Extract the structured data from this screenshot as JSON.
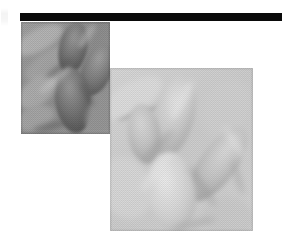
{
  "figure": {
    "background_color": "#ffffff",
    "width": 282,
    "height": 251,
    "caption_text": "",
    "header_rule": {
      "name": "black-header-rule",
      "color": "#0a0a0a",
      "x": 20,
      "y": 13,
      "width": 262,
      "height": 8
    },
    "edge_artifact": {
      "name": "scan-edge-artifact",
      "color": "#e8e8e8",
      "x": 1,
      "y": 8,
      "width": 7,
      "height": 18
    },
    "panels": [
      {
        "id": "panel-a",
        "label": "",
        "description": "darker grayscale micrograph of overlapping elongated rounded cell structures",
        "x": 21,
        "y": 22,
        "width": 89,
        "height": 112,
        "base_color": "#8e8e8e",
        "tone": "dark",
        "mid_tone": "#8a8a8a",
        "light_tone": "#bdbdbd",
        "dark_tone": "#5e5e5e",
        "texture": "halftone-dither"
      },
      {
        "id": "panel-b",
        "label": "",
        "description": "lighter grayscale micrograph of overlapping elongated rounded cell structures",
        "x": 110,
        "y": 68,
        "width": 143,
        "height": 163,
        "base_color": "#cfcfcf",
        "tone": "light",
        "mid_tone": "#c9c9c9",
        "light_tone": "#e6e6e6",
        "dark_tone": "#a4a4a4",
        "texture": "halftone-dither"
      }
    ]
  }
}
